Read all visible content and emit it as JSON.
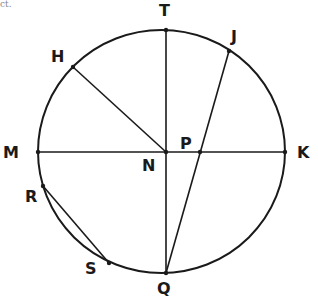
{
  "crop_fragment": "ct.",
  "diagram": {
    "type": "circle-geometry",
    "center": {
      "name": "N",
      "x": 166,
      "y": 152
    },
    "circle": {
      "cx": 161.5,
      "cy": 151.5,
      "rx": 123.5,
      "ry": 121.5
    },
    "points": {
      "T": {
        "label": "T",
        "x": 166,
        "y": 30,
        "lx": 159,
        "ly": 16
      },
      "J": {
        "label": "J",
        "x": 229,
        "y": 51,
        "lx": 231,
        "ly": 42
      },
      "H": {
        "label": "H",
        "x": 73,
        "y": 67,
        "lx": 51,
        "ly": 62
      },
      "M": {
        "label": "M",
        "x": 38,
        "y": 152,
        "lx": 3,
        "ly": 158
      },
      "N": {
        "label": "N",
        "x": 166,
        "y": 152,
        "lx": 142,
        "ly": 171
      },
      "P": {
        "label": "P",
        "x": 200,
        "y": 152,
        "lx": 180,
        "ly": 149
      },
      "K": {
        "label": "K",
        "x": 285,
        "y": 152,
        "lx": 297,
        "ly": 158
      },
      "R": {
        "label": "R",
        "x": 43,
        "y": 186,
        "lx": 25,
        "ly": 202
      },
      "S": {
        "label": "S",
        "x": 109,
        "y": 263,
        "lx": 85,
        "ly": 274
      },
      "Q": {
        "label": "Q",
        "x": 166,
        "y": 273,
        "lx": 157,
        "ly": 294
      }
    },
    "segments": [
      {
        "name": "diameter-MK",
        "from": "M",
        "to": "K"
      },
      {
        "name": "diameter-TQ",
        "from": "T",
        "to": "Q"
      },
      {
        "name": "radius-NH",
        "from": "N",
        "to": "H"
      },
      {
        "name": "chord-JQ",
        "from": "J",
        "to": "Q"
      },
      {
        "name": "chord-RS",
        "from": "R",
        "to": "S"
      }
    ],
    "stroke_color": "#1a1a1a",
    "background": "#ffffff"
  }
}
